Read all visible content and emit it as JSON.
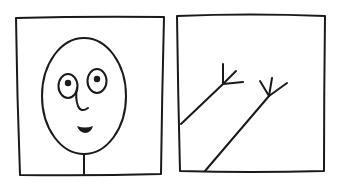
{
  "panels": [
    {
      "id": "face-panel",
      "content": "hand-drawn face on a stick neck",
      "elements": [
        "frame",
        "head",
        "left-eye",
        "right-eye",
        "nose",
        "smile",
        "neck"
      ]
    },
    {
      "id": "branches-panel",
      "content": "two diagonal lines ending in forked tips",
      "elements": [
        "frame",
        "branch-1",
        "branch-2"
      ]
    }
  ],
  "colors": {
    "ink": "#1a1a1a",
    "paper": "#ffffff"
  }
}
